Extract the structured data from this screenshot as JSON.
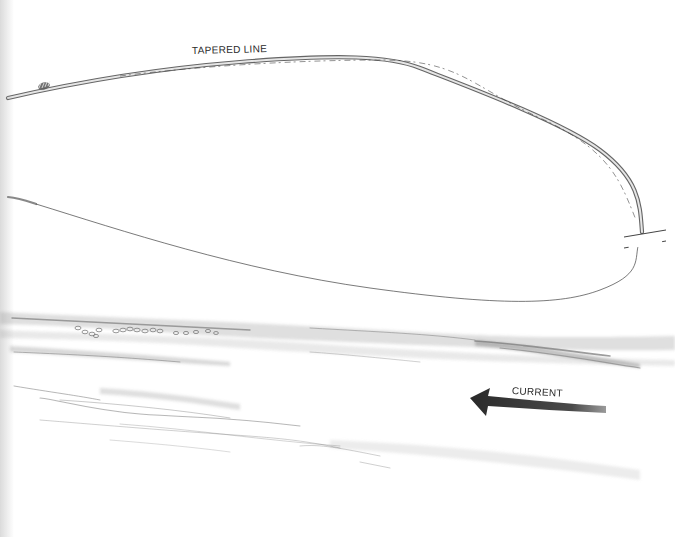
{
  "illustration": {
    "subject": "Fly line loop over current",
    "labels": {
      "tapered_line": "TAPERED LINE",
      "current": "CURRENT"
    },
    "colors": {
      "background": "#ffffff",
      "pencil_dark": "#2e2e2e",
      "pencil_mid": "#8a8a8a",
      "pencil_light": "#c8c8c8",
      "arrow": "#3a3a3a"
    },
    "elements": {
      "upper_line": "Thick tapered fly line forming upper arc of loop",
      "knot": "Nail knot near left end of tapered line",
      "lower_line": "Thin leader/tippet forming lower arc of loop",
      "break_marks": "Two parallel break marks on right side of loop",
      "water": "Shaded water surface with bubbles and ripples",
      "arrow": "Arrow pointing left indicating current direction"
    }
  }
}
